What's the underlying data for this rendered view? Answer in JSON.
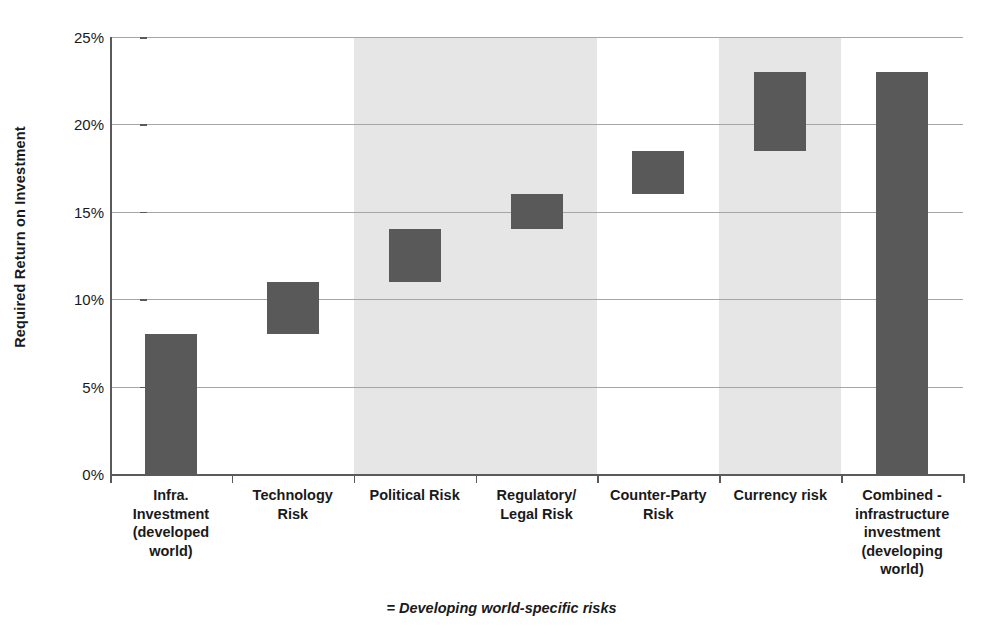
{
  "chart_data": {
    "type": "bar",
    "chart_style": "waterfall",
    "title": "",
    "xlabel": "",
    "ylabel": "Required Return on Investment",
    "ylim": [
      0,
      25
    ],
    "yunit": "%",
    "ytick_labels": [
      "0%",
      "5%",
      "10%",
      "15%",
      "20%",
      "25%"
    ],
    "ytick_values": [
      0,
      5,
      10,
      15,
      20,
      25
    ],
    "grid": true,
    "grid_axis": "y",
    "legend": "none",
    "categories": [
      "Infra. Investment (developed world)",
      "Technology Risk",
      "Political Risk",
      "Regulatory/ Legal Risk",
      "Counter-Party Risk",
      "Currency risk",
      "Combined - infrastructure investment (developing world)"
    ],
    "category_label_lines": [
      [
        "Infra.",
        "Investment",
        "(developed",
        "world)"
      ],
      [
        "Technology",
        "Risk"
      ],
      [
        "Political Risk"
      ],
      [
        "Regulatory/",
        "Legal Risk"
      ],
      [
        "Counter-Party",
        "Risk"
      ],
      [
        "Currency risk"
      ],
      [
        "Combined -",
        "infrastructure",
        "investment",
        "(developing",
        "world)"
      ]
    ],
    "bars": [
      {
        "category": "Infra. Investment (developed world)",
        "base": 0,
        "top": 8,
        "delta": 8,
        "highlighted": false
      },
      {
        "category": "Technology Risk",
        "base": 8,
        "top": 11,
        "delta": 3,
        "highlighted": false
      },
      {
        "category": "Political Risk",
        "base": 11,
        "top": 14,
        "delta": 3,
        "highlighted": true
      },
      {
        "category": "Regulatory/ Legal Risk",
        "base": 14,
        "top": 16,
        "delta": 2,
        "highlighted": true
      },
      {
        "category": "Counter-Party Risk",
        "base": 16,
        "top": 18.5,
        "delta": 2.5,
        "highlighted": false
      },
      {
        "category": "Currency risk",
        "base": 18.5,
        "top": 23,
        "delta": 4.5,
        "highlighted": true
      },
      {
        "category": "Combined - infrastructure investment (developing world)",
        "base": 0,
        "top": 23,
        "delta": 23,
        "highlighted": false
      }
    ],
    "shaded_bands": [
      {
        "label": "Developing world-specific risks",
        "from_category": "Political Risk",
        "to_category": "Regulatory/ Legal Risk"
      },
      {
        "label": "Developing world-specific risks",
        "from_category": "Currency risk",
        "to_category": "Currency risk"
      }
    ],
    "annotation": "= Developing world-specific risks",
    "colors": {
      "bar_fill": "#595959",
      "shade_band": "#e6e6e6",
      "gridline": "#a6a6a6",
      "axis": "#5a5a5a",
      "text": "#1a1a1a",
      "background": "#ffffff"
    }
  }
}
